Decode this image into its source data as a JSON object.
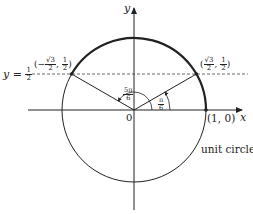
{
  "diagram": {
    "axes": {
      "x_label": "x",
      "y_label": "y",
      "origin_label": "0"
    },
    "circle_label": "unit circle",
    "point_on_x_axis": "(1, 0)",
    "horizontal_line": {
      "lhs": "y =",
      "num": "1",
      "den": "2"
    },
    "point_left": {
      "prefix": "(−",
      "num1": "√3",
      "den1": "2",
      "sep": ",",
      "num2": "1",
      "den2": "2",
      "suffix": ")"
    },
    "point_right": {
      "prefix": "(",
      "num1": "√3",
      "den1": "2",
      "sep": ",",
      "num2": "1",
      "den2": "2",
      "suffix": ")"
    },
    "angle_large": {
      "num": "5π",
      "den": "6"
    },
    "angle_small": {
      "num": "π",
      "den": "6"
    },
    "colors": {
      "stroke": "#222222",
      "background": "#ffffff"
    }
  }
}
